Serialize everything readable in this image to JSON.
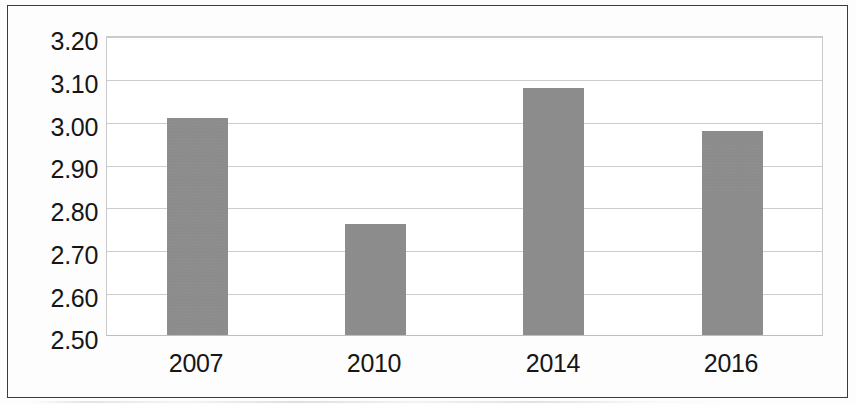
{
  "chart_data": {
    "type": "bar",
    "title": "",
    "subtitle": "",
    "xlabel": "",
    "ylabel": "",
    "categories": [
      "2007",
      "2010",
      "2014",
      "2016"
    ],
    "values": [
      3.01,
      2.76,
      3.08,
      2.98
    ],
    "series": [
      {
        "name": "",
        "values": [
          3.01,
          2.76,
          3.08,
          2.98
        ]
      }
    ],
    "ylim": [
      2.5,
      3.2
    ],
    "yticks": [
      2.5,
      2.6,
      2.7,
      2.8,
      2.9,
      3.0,
      3.1,
      3.2
    ],
    "ytick_labels": [
      "2.50",
      "2.60",
      "2.70",
      "2.80",
      "2.90",
      "3.00",
      "3.10",
      "3.20"
    ],
    "xtick_labels": [
      "2007",
      "2010",
      "2014",
      "2016"
    ],
    "grid": true,
    "grid_axis": "y",
    "legend": false,
    "legend_position": "none",
    "bar_color": "#8e8e8e",
    "grid_color": "#cdcdcd",
    "plot_border_color": "#c9c9c9",
    "frame_border_color": "#3b3b3b",
    "background_color": "#fdfdfd",
    "text_color": "#161616",
    "annotations": []
  }
}
